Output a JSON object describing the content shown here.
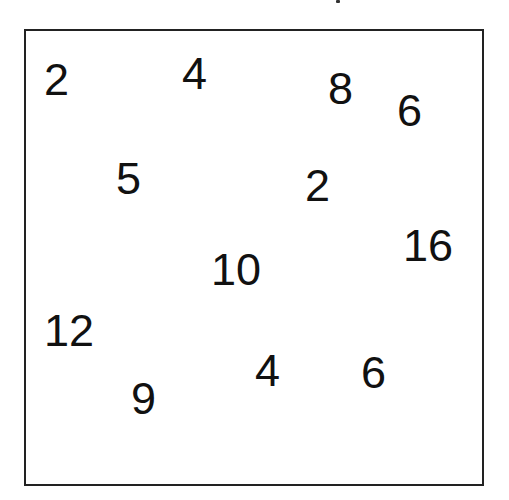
{
  "diagram": {
    "title": "",
    "frame": {
      "border_color": "#222222",
      "background": "#ffffff"
    },
    "text_color": "#111111",
    "numbers": [
      {
        "value": "2",
        "x": 44,
        "y": 57
      },
      {
        "value": "4",
        "x": 182,
        "y": 51
      },
      {
        "value": "8",
        "x": 328,
        "y": 66
      },
      {
        "value": "6",
        "x": 397,
        "y": 88
      },
      {
        "value": "5",
        "x": 116,
        "y": 156
      },
      {
        "value": "2",
        "x": 305,
        "y": 163
      },
      {
        "value": "16",
        "x": 403,
        "y": 223
      },
      {
        "value": "10",
        "x": 211,
        "y": 247
      },
      {
        "value": "12",
        "x": 44,
        "y": 308
      },
      {
        "value": "9",
        "x": 131,
        "y": 376
      },
      {
        "value": "4",
        "x": 255,
        "y": 348
      },
      {
        "value": "6",
        "x": 361,
        "y": 350
      }
    ]
  }
}
